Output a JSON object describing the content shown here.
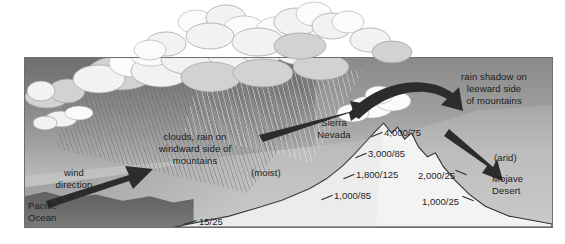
{
  "diagram": {
    "frame": {
      "border_color": "#6e6e6e",
      "background": "#ffffff"
    },
    "labels": {
      "wind_direction": "wind\ndirection",
      "wind_direction_line1": "wind",
      "wind_direction_line2": "direction",
      "pacific_ocean_line1": "Pacific",
      "pacific_ocean_line2": "Ocean",
      "windward_line1": "clouds, rain on",
      "windward_line2": "windward side of",
      "windward_line3": "mountains",
      "moist": "(moist)",
      "sierra_line1": "Sierra",
      "sierra_line2": "Nevada",
      "rain_shadow_line1": "rain shadow on",
      "rain_shadow_line2": "leeward side",
      "rain_shadow_line3": "of mountains",
      "arid": "(arid)",
      "mojave_line1": "Mojave",
      "mojave_line2": "Desert"
    },
    "elevation_readings": [
      {
        "name": "sea-level-windward",
        "value": "15/25"
      },
      {
        "name": "windward-1000",
        "value": "1,000/85"
      },
      {
        "name": "windward-1800",
        "value": "1,800/125"
      },
      {
        "name": "windward-3000",
        "value": "3,000/85"
      },
      {
        "name": "summit-4000",
        "value": "4,000/75"
      },
      {
        "name": "leeward-2000",
        "value": "2,000/25"
      },
      {
        "name": "leeward-1000",
        "value": "1,000/25"
      }
    ],
    "arrows": [
      {
        "name": "wind-arrow-left",
        "direction": "up-right"
      },
      {
        "name": "upslope-arrow",
        "direction": "down-left"
      },
      {
        "name": "over-summit-arrow",
        "direction": "curved-right"
      },
      {
        "name": "descending-arrow",
        "direction": "down-right"
      }
    ],
    "colors": {
      "sky_top": "#6f6f6f",
      "sky_bottom": "#cfcfcf",
      "ground": "#bdbdbd",
      "ocean": "#5b5b5b",
      "mountain": "#f3f3f3",
      "arrow": "#2c2c2c",
      "text": "#1c1c1c"
    }
  }
}
